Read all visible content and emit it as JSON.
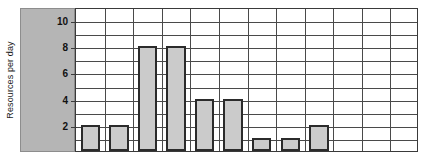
{
  "chart_data": {
    "type": "bar",
    "title": "",
    "xlabel": "",
    "ylabel": "Resources per day",
    "categories": [
      "1",
      "2",
      "3",
      "4",
      "5",
      "6",
      "7",
      "8",
      "9",
      "10",
      "11",
      "12"
    ],
    "values": [
      2,
      2,
      8,
      8,
      4,
      4,
      1,
      1,
      2,
      0,
      0,
      0
    ],
    "ylim": [
      0,
      11
    ],
    "ytick_labels": [
      "2",
      "4",
      "6",
      "8",
      "10"
    ],
    "ytick_values": [
      2,
      4,
      6,
      8,
      10
    ],
    "grid": true,
    "legend": "none",
    "n_columns": 12,
    "n_rows": 11,
    "colors": {
      "bar_fill": "#cbcbcb",
      "bar_stroke": "#2b2b2b",
      "grid_line": "#4a4a4a",
      "axis_line": "#3a3a3a",
      "label_panel": "#b5b5b5",
      "plot_background": "#ffffff",
      "text": "#1a1a1a"
    }
  }
}
